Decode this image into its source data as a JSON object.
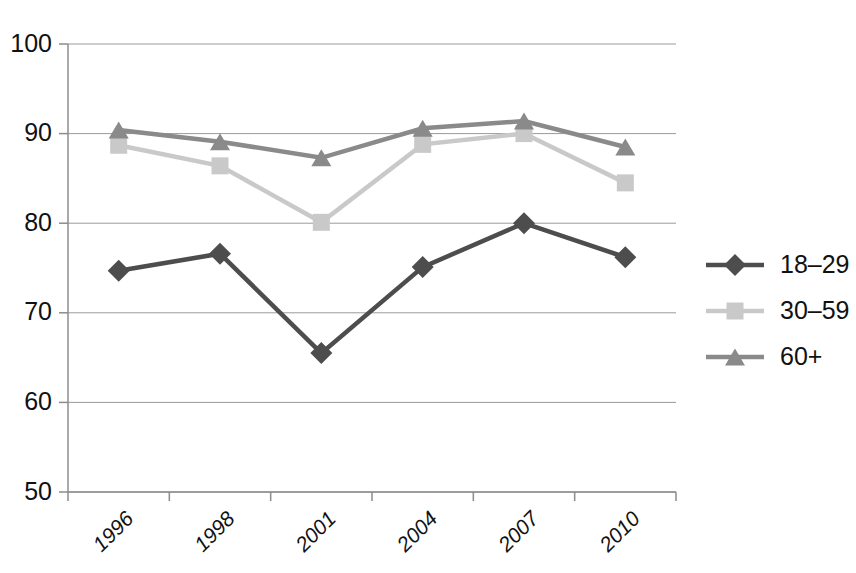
{
  "chart_data": {
    "type": "line",
    "title": "",
    "subtitle": "",
    "xlabel": "",
    "ylabel": "",
    "categories": [
      "1996",
      "1998",
      "2001",
      "2004",
      "2007",
      "2010"
    ],
    "ylim": [
      50,
      100
    ],
    "yticks": [
      50,
      60,
      70,
      80,
      90,
      100
    ],
    "ytick_labels": [
      "50",
      "60",
      "70",
      "80",
      "90",
      "100"
    ],
    "grid": true,
    "legend_position": "right",
    "series": [
      {
        "name": "18–29",
        "marker": "diamond",
        "color": "#4d4d4d",
        "values": [
          74.7,
          76.6,
          65.5,
          75.1,
          80.0,
          76.2
        ]
      },
      {
        "name": "30–59",
        "marker": "square",
        "color": "#c9c9c9",
        "values": [
          88.7,
          86.4,
          80.1,
          88.8,
          90.0,
          84.5
        ]
      },
      {
        "name": "60+",
        "marker": "triangle",
        "color": "#8a8a8a",
        "values": [
          90.4,
          89.1,
          87.3,
          90.6,
          91.4,
          88.5
        ]
      }
    ]
  },
  "legend": {
    "entries": [
      {
        "label": "18–29"
      },
      {
        "label": "30–59"
      },
      {
        "label": "60+"
      }
    ]
  },
  "axes": {
    "y": {
      "labels": [
        "100",
        "90",
        "80",
        "70",
        "60",
        "50"
      ]
    },
    "x": {
      "labels": [
        "1996",
        "1998",
        "2001",
        "2004",
        "2007",
        "2010"
      ]
    }
  },
  "colors": {
    "series_18_29": "#4d4d4d",
    "series_30_59": "#c9c9c9",
    "series_60_plus": "#8a8a8a",
    "grid": "#9a9a9a",
    "axis": "#8c8c8c",
    "background": "#ffffff",
    "text": "#111111"
  }
}
